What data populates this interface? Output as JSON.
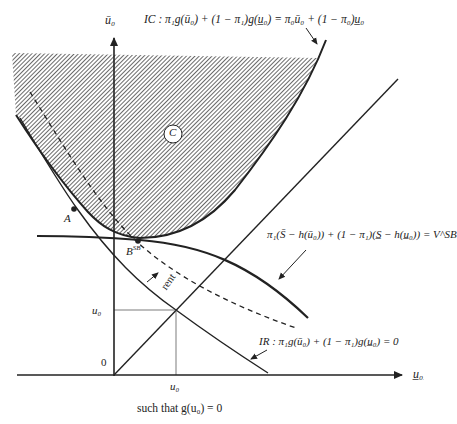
{
  "diagram": {
    "type": "economics-contract-diagram",
    "axes": {
      "y_label": "ū₀",
      "x_label": "u̲₀",
      "origin_label": "0"
    },
    "labels": {
      "ic_equation": "IC : π₁g(ū₀) + (1 − π₁)g(u̲₀) = π₀ū₀ + (1 − π₀)u̲₀",
      "vsb_equation": "π₁(S̄ − h(ū₀)) + (1 − π₁)(S̲ − h(u̲₀)) = V^SB",
      "ir_equation": "IR : π₁g(ū₀) + (1 − π₁)g(u̲₀) = 0",
      "region_c": "C",
      "point_a": "A",
      "point_bsb": "B",
      "point_bsb_sup": "SB",
      "rent": "rent",
      "u0_y_tick": "u₀",
      "u0_x_tick": "u₀",
      "caption": "such that g(u₀) = 0"
    },
    "colors": {
      "line": "#222222",
      "hatch": "#555555",
      "background": "#ffffff"
    }
  }
}
